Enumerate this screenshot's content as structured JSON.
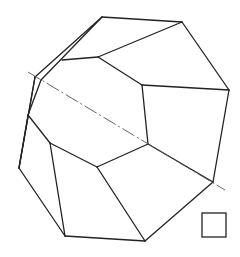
{
  "diagram": {
    "title": "",
    "stroke_color": "#222222",
    "axis_color": "#555555",
    "background": "#ffffff",
    "edges": [
      [
        102,
        17,
        182,
        22
      ],
      [
        182,
        22,
        229,
        90
      ],
      [
        229,
        90,
        213,
        182
      ],
      [
        213,
        182,
        145,
        241
      ],
      [
        145,
        241,
        65,
        236
      ],
      [
        65,
        236,
        19,
        168
      ],
      [
        19,
        168,
        35,
        77
      ],
      [
        35,
        77,
        102,
        17
      ],
      [
        41,
        80,
        102,
        17
      ],
      [
        41,
        80,
        28,
        115
      ],
      [
        35,
        77,
        19,
        168
      ],
      [
        62,
        60,
        98,
        57
      ],
      [
        98,
        57,
        182,
        22
      ],
      [
        98,
        57,
        142,
        85
      ],
      [
        142,
        85,
        229,
        90
      ],
      [
        142,
        85,
        148,
        144
      ],
      [
        148,
        144,
        213,
        182
      ],
      [
        148,
        144,
        97,
        167
      ],
      [
        97,
        167,
        145,
        241
      ],
      [
        97,
        167,
        50,
        143
      ],
      [
        50,
        143,
        65,
        236
      ],
      [
        50,
        143,
        28,
        115
      ],
      [
        28,
        115,
        19,
        168
      ]
    ],
    "axis_line": [
      28,
      72,
      225,
      190
    ],
    "square": {
      "x": 202,
      "y": 213,
      "w": 24,
      "h": 24
    }
  }
}
